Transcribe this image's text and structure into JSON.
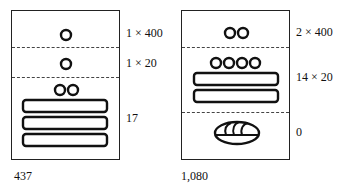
{
  "figures": [
    {
      "id": "left",
      "total": "437",
      "levels": [
        {
          "position": "top",
          "label": "1 × 400",
          "glyph_summary": "1 dot",
          "dots": 1,
          "bars": 0,
          "shell": false
        },
        {
          "position": "middle",
          "label": "1 × 20",
          "glyph_summary": "1 dot",
          "dots": 1,
          "bars": 0,
          "shell": false
        },
        {
          "position": "bottom",
          "label": "17",
          "glyph_summary": "2 dots over 3 bars",
          "dots": 2,
          "bars": 3,
          "shell": false
        }
      ]
    },
    {
      "id": "right",
      "total": "1,080",
      "levels": [
        {
          "position": "top",
          "label": "2 × 400",
          "glyph_summary": "2 dots",
          "dots": 2,
          "bars": 0,
          "shell": false
        },
        {
          "position": "middle",
          "label": "14 × 20",
          "glyph_summary": "4 dots over 2 bars",
          "dots": 4,
          "bars": 2,
          "shell": false
        },
        {
          "position": "bottom",
          "label": "0",
          "glyph_summary": "shell (zero)",
          "dots": 0,
          "bars": 0,
          "shell": true
        }
      ]
    }
  ]
}
